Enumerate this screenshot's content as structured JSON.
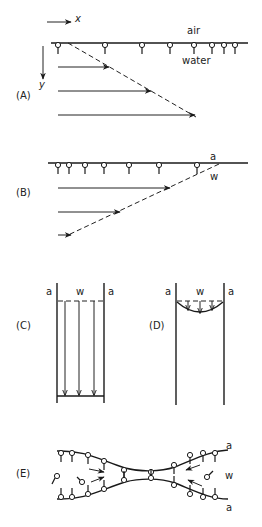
{
  "panels": {
    "A": {
      "label": "(A)",
      "axis_x": "x",
      "axis_y": "y",
      "air": "air",
      "water": "water"
    },
    "B": {
      "label": "(B)",
      "air": "a",
      "water": "w"
    },
    "C": {
      "label": "(C)",
      "air_left": "a",
      "water": "w",
      "air_right": "a"
    },
    "D": {
      "label": "(D)",
      "air_left": "a",
      "water": "w",
      "air_right": "a"
    },
    "E": {
      "label": "(E)",
      "air_top": "a",
      "water": "w",
      "air_bottom": "a"
    }
  },
  "colors": {
    "ink": "#1a1a1a",
    "background": "#ffffff"
  }
}
